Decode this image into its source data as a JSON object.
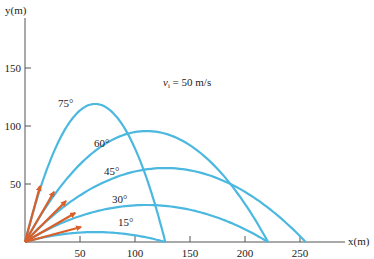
{
  "chart_data": {
    "type": "line",
    "title": "",
    "xlabel": "x(m)",
    "ylabel": "y(m)",
    "xlim": [
      0,
      290
    ],
    "ylim": [
      0,
      200
    ],
    "grid": false,
    "legend": "none",
    "x_ticks": [
      50,
      100,
      150,
      200,
      250
    ],
    "y_ticks": [
      50,
      100,
      150
    ],
    "annotation": "v_i = 50 m/s",
    "initial_speed_mps": 50,
    "g": 9.8,
    "series": [
      {
        "name": "15°",
        "angle_deg": 15,
        "range_m": 127.6,
        "max_height_m": 8.5
      },
      {
        "name": "30°",
        "angle_deg": 30,
        "range_m": 220.9,
        "max_height_m": 31.9
      },
      {
        "name": "45°",
        "angle_deg": 45,
        "range_m": 255.1,
        "max_height_m": 63.8
      },
      {
        "name": "60°",
        "angle_deg": 60,
        "range_m": 220.9,
        "max_height_m": 95.7
      },
      {
        "name": "75°",
        "angle_deg": 75,
        "range_m": 127.6,
        "max_height_m": 119.0
      }
    ]
  },
  "labels": {
    "xlabel": "x(m)",
    "ylabel": "y(m)",
    "v_symbol": "v",
    "v_sub": "i",
    "v_rest": " = 50 m/s",
    "x_ticks": [
      "50",
      "100",
      "150",
      "200",
      "250"
    ],
    "y_ticks": [
      "50",
      "100",
      "150"
    ],
    "angles": [
      "15°",
      "30°",
      "45°",
      "60°",
      "75°"
    ]
  },
  "colors": {
    "trajectory": "#4bb8e0",
    "velocity_vector": "#d9602a",
    "axis": "#555555"
  }
}
